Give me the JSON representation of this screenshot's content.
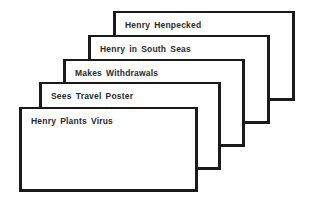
{
  "diagram": {
    "type": "stacked-cards",
    "cards": [
      {
        "label": "Henry Henpecked",
        "left": 113,
        "top": 11,
        "width": 182,
        "height": 90
      },
      {
        "label": "Henry in South Seas",
        "left": 88,
        "top": 35,
        "width": 182,
        "height": 89
      },
      {
        "label": "Makes  Withdrawals",
        "left": 63,
        "top": 59,
        "width": 182,
        "height": 88
      },
      {
        "label": "Sees Travel Poster",
        "left": 39,
        "top": 82,
        "width": 182,
        "height": 88
      },
      {
        "label": "Henry  Plants  Virus",
        "left": 19,
        "top": 107,
        "width": 179,
        "height": 85
      }
    ]
  }
}
